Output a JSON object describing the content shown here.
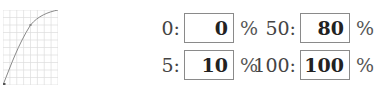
{
  "curve_graph": {
    "grid_cols": 8,
    "grid_rows": 10,
    "grid_color": "#d0d0d0",
    "curve_color": "#888888",
    "points": [
      [
        0,
        0
      ],
      [
        5,
        10
      ],
      [
        50,
        80
      ],
      [
        100,
        100
      ]
    ]
  },
  "fields": [
    {
      "label": "0:",
      "value": "0",
      "unit": "%"
    },
    {
      "label": "5:",
      "value": "10",
      "unit": "%"
    },
    {
      "label": "50:",
      "value": "80",
      "unit": "%"
    },
    {
      "label": "100:",
      "value": "100",
      "unit": "%"
    }
  ]
}
